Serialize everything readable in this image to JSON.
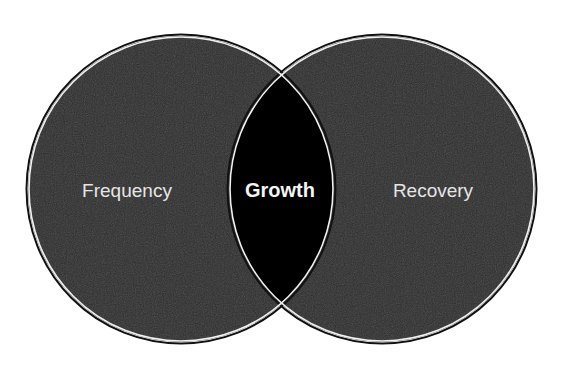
{
  "diagram": {
    "type": "venn",
    "colors": {
      "background": "#ffffff",
      "circle_fill": "#2e2e2e",
      "overlap_fill": "#000000",
      "outline_outer": "#111111",
      "outline_inner": "#f2f2f2",
      "text": "#e6e6e6"
    },
    "circles": [
      {
        "label": "Frequency",
        "cx": 181,
        "cy": 189,
        "r": 153
      },
      {
        "label": "Recovery",
        "cx": 382,
        "cy": 189,
        "r": 153
      }
    ],
    "intersection": {
      "label": "Growth"
    }
  }
}
